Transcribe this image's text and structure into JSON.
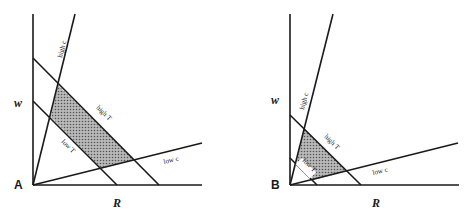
{
  "panels": [
    {
      "id": "A",
      "label": "A",
      "x_axis_label": "R",
      "y_axis_label": "w",
      "lines": {
        "high_c": "high c",
        "low_c": "low c",
        "high_T": "high T",
        "low_T": "low T"
      }
    },
    {
      "id": "B",
      "label": "B",
      "x_axis_label": "R",
      "y_axis_label": "w",
      "lines": {
        "high_c": "high c",
        "low_c": "low c",
        "high_T": "high T",
        "low_T": "low T"
      }
    }
  ],
  "colors": {
    "line": "#1a1a1a",
    "shade": "#8a8a8a",
    "background": "#ffffff"
  }
}
